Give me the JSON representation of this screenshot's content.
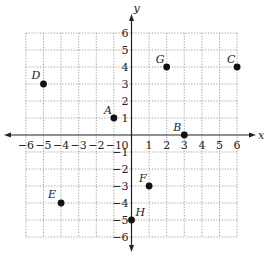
{
  "diagram": {
    "type": "coordinate-plane",
    "axes": {
      "x_label": "x",
      "y_label": "y",
      "x_range": [
        -6,
        6
      ],
      "y_range": [
        -6,
        6
      ]
    },
    "x_ticks": [
      "−6",
      "−5",
      "−4",
      "−3",
      "−2",
      "−1",
      "1",
      "2",
      "3",
      "4",
      "5",
      "6"
    ],
    "y_ticks": [
      "6",
      "5",
      "4",
      "3",
      "2",
      "1",
      "−1",
      "−2",
      "−3",
      "−4",
      "−5",
      "−6"
    ],
    "origin_label": "0",
    "points": [
      {
        "label": "A",
        "x": -1,
        "y": 1
      },
      {
        "label": "B",
        "x": 3,
        "y": 0
      },
      {
        "label": "C",
        "x": 6,
        "y": 4
      },
      {
        "label": "D",
        "x": -5,
        "y": 3
      },
      {
        "label": "E",
        "x": -4,
        "y": -4
      },
      {
        "label": "F",
        "x": 1,
        "y": -3
      },
      {
        "label": "G",
        "x": 2,
        "y": 4
      },
      {
        "label": "H",
        "x": 0,
        "y": -5
      }
    ]
  }
}
